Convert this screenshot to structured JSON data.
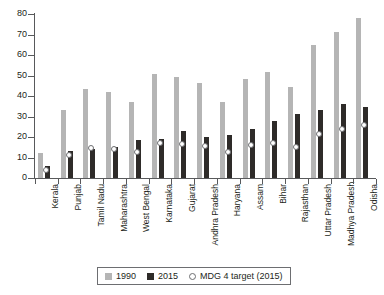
{
  "chart_data": {
    "type": "bar",
    "title": "",
    "xlabel": "",
    "ylabel": "",
    "ylim": [
      0,
      80
    ],
    "ytick_step": 10,
    "yticks": [
      80,
      70,
      60,
      50,
      40,
      30,
      20,
      10,
      0
    ],
    "grid": false,
    "legend_position": "bottom-center",
    "categories": [
      "Kerala",
      "Punjab",
      "Tamil Nadu",
      "Maharashtra",
      "West Bengal",
      "Karnataka",
      "Gujarat",
      "Andhra Pradesh",
      "Haryana",
      "Assam",
      "Bihar",
      "Rajasthan",
      "Uttar Pradesh",
      "Madhya Pradesh",
      "Odisha"
    ],
    "series": [
      {
        "name": "1990",
        "color": "#b5b5b5",
        "type": "bar",
        "values": [
          12,
          33,
          43.5,
          42,
          37,
          50.5,
          49.5,
          46.5,
          37,
          48.5,
          51.5,
          44.5,
          65,
          71,
          78
        ]
      },
      {
        "name": "2015",
        "color": "#2e2b29",
        "type": "bar",
        "values": [
          6,
          13,
          14,
          15,
          18.5,
          19,
          23,
          20,
          21,
          24,
          28,
          31,
          33,
          36,
          34.5
        ]
      },
      {
        "name": "MDG 4 target (2015)",
        "color": "#ffffff",
        "type": "marker",
        "values": [
          4,
          11,
          14.5,
          14,
          12.5,
          17,
          16.5,
          15.5,
          12.5,
          16,
          17,
          15,
          21.5,
          24,
          26
        ]
      }
    ]
  },
  "legend": {
    "items": [
      {
        "label": "1990"
      },
      {
        "label": "2015"
      },
      {
        "label": "MDG 4 target (2015)"
      }
    ]
  },
  "colors": {
    "series_1990": "#b5b5b5",
    "series_2015": "#2e2b29",
    "marker_fill": "#ffffff",
    "marker_stroke": "#6d6e71",
    "axis": "#58595b",
    "text": "#231f20",
    "background": "#ffffff"
  }
}
